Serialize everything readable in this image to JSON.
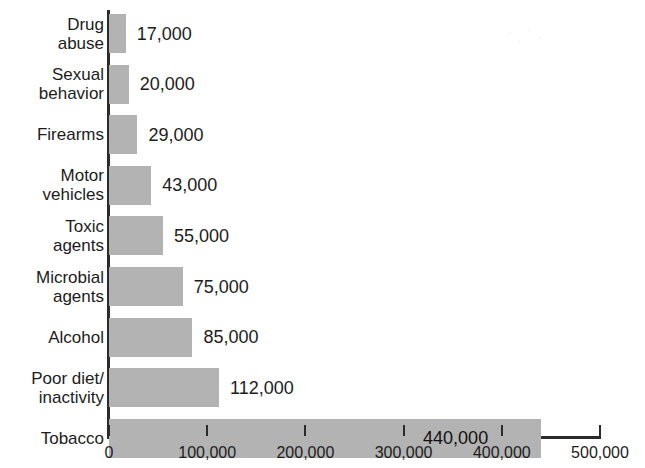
{
  "chart_data": {
    "type": "bar",
    "orientation": "horizontal",
    "title": "",
    "subtitle": "",
    "xlabel": "",
    "ylabel": "",
    "xlim": [
      0,
      500000
    ],
    "grid": false,
    "legend": false,
    "categories": [
      "Drug\nabuse",
      "Sexual\nbehavior",
      "Firearms",
      "Motor\nvehicles",
      "Toxic\nagents",
      "Microbial\nagents",
      "Alcohol",
      "Poor diet/\ninactivity",
      "Tobacco"
    ],
    "values": [
      17000,
      20000,
      29000,
      43000,
      55000,
      75000,
      85000,
      112000,
      440000
    ],
    "value_labels": [
      "17,000",
      "20,000",
      "29,000",
      "43,000",
      "55,000",
      "75,000",
      "85,000",
      "112,000",
      "440,000"
    ],
    "label_placement": [
      "outside",
      "outside",
      "outside",
      "outside",
      "outside",
      "outside",
      "outside",
      "outside",
      "inside"
    ],
    "xticks": [
      0,
      100000,
      200000,
      300000,
      400000,
      500000
    ],
    "xtick_labels": [
      "0",
      "100,000",
      "200,000",
      "300,000",
      "400,000",
      "500,000"
    ],
    "bar_color": "#b3b3b3",
    "axis_color": "#2b2b2b",
    "text_color": "#1c1c1c"
  }
}
